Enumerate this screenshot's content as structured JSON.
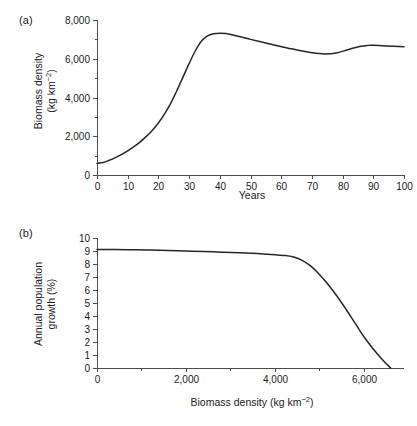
{
  "figure": {
    "width": 417,
    "height": 426,
    "background": "#ffffff",
    "line_color": "#262626",
    "axis_color": "#4d4d4d"
  },
  "panels": [
    {
      "id": "a",
      "label": "(a)",
      "xlabel": "Years",
      "ylabel_line1": "Biomass density",
      "ylabel_line2_pre": "(kg km",
      "ylabel_line2_sup": "−2",
      "ylabel_line2_post": ")",
      "xticks": [
        "0",
        "10",
        "20",
        "30",
        "40",
        "50",
        "60",
        "70",
        "80",
        "90",
        "100"
      ],
      "yticks": [
        "0",
        "2,000",
        "4,000",
        "6,000",
        "8,000"
      ]
    },
    {
      "id": "b",
      "label": "(b)",
      "xlabel_pre": "Biomass density (kg km",
      "xlabel_sup": "−2",
      "xlabel_post": ")",
      "ylabel_line1": "Annual population",
      "ylabel_line2": "growth (%)",
      "xticks": [
        "0",
        "2,000",
        "4,000",
        "6,000"
      ],
      "yticks": [
        "0",
        "1",
        "2",
        "3",
        "4",
        "5",
        "6",
        "7",
        "8",
        "9",
        "10"
      ]
    }
  ],
  "chart_data": [
    {
      "type": "line",
      "panel": "a",
      "title": "",
      "xlabel": "Years",
      "ylabel": "Biomass density (kg km−2)",
      "xlim": [
        0,
        100
      ],
      "ylim": [
        0,
        8000
      ],
      "xticks": [
        0,
        10,
        20,
        30,
        40,
        50,
        60,
        70,
        80,
        90,
        100
      ],
      "yticks": [
        0,
        2000,
        4000,
        6000,
        8000
      ],
      "minor_yticks": [
        1000,
        3000,
        5000,
        7000
      ],
      "grid": false,
      "legend": false,
      "series": [
        {
          "name": "Biomass density over time",
          "x": [
            0,
            2,
            4,
            6,
            8,
            10,
            12,
            14,
            16,
            18,
            20,
            22,
            24,
            26,
            28,
            30,
            32,
            34,
            36,
            38,
            40,
            42,
            44,
            46,
            48,
            50,
            54,
            58,
            62,
            66,
            70,
            74,
            78,
            82,
            86,
            88,
            90,
            94,
            100
          ],
          "y": [
            600,
            640,
            760,
            900,
            1060,
            1250,
            1460,
            1700,
            1980,
            2300,
            2680,
            3150,
            3700,
            4350,
            5050,
            5750,
            6400,
            6900,
            7180,
            7290,
            7320,
            7300,
            7240,
            7160,
            7080,
            7000,
            6850,
            6700,
            6560,
            6420,
            6310,
            6250,
            6300,
            6480,
            6640,
            6690,
            6700,
            6660,
            6620
          ]
        }
      ]
    },
    {
      "type": "line",
      "panel": "b",
      "title": "",
      "xlabel": "Biomass density (kg km−2)",
      "ylabel": "Annual population growth (%)",
      "xlim": [
        0,
        6900
      ],
      "ylim": [
        0,
        10
      ],
      "xticks": [
        0,
        2000,
        4000,
        6000
      ],
      "minor_xticks": [
        1000,
        3000,
        5000
      ],
      "yticks": [
        0,
        1,
        2,
        3,
        4,
        5,
        6,
        7,
        8,
        9,
        10
      ],
      "grid": false,
      "legend": false,
      "series": [
        {
          "name": "Annual population growth vs biomass density",
          "x": [
            0,
            400,
            800,
            1200,
            1600,
            2000,
            2400,
            2800,
            3200,
            3600,
            4000,
            4200,
            4400,
            4600,
            4800,
            5000,
            5200,
            5400,
            5600,
            5800,
            6000,
            6200,
            6400,
            6600
          ],
          "y": [
            9.12,
            9.11,
            9.09,
            9.07,
            9.04,
            9.0,
            8.96,
            8.91,
            8.86,
            8.8,
            8.72,
            8.66,
            8.55,
            8.3,
            7.85,
            7.2,
            6.4,
            5.5,
            4.5,
            3.45,
            2.4,
            1.5,
            0.7,
            0.0
          ]
        }
      ]
    }
  ]
}
